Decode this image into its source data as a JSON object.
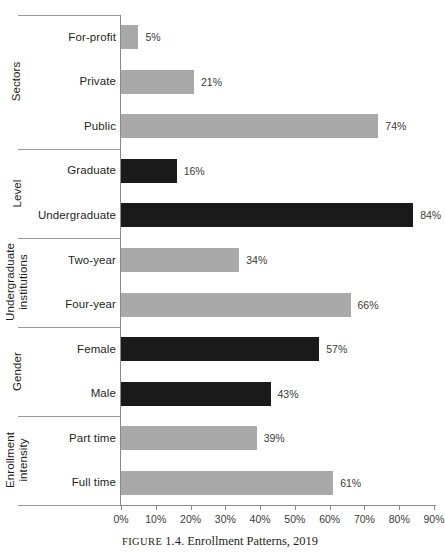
{
  "caption": {
    "figure_word": "FIGURE",
    "number": "1.4.",
    "title": "Enrollment Patterns, 2019"
  },
  "chart_data": {
    "type": "bar",
    "orientation": "horizontal",
    "title": "Enrollment Patterns, 2019",
    "xlabel": "",
    "ylabel": "",
    "xlim": [
      0,
      90
    ],
    "xticks": [
      "0%",
      "10%",
      "20%",
      "30%",
      "40%",
      "50%",
      "60%",
      "70%",
      "80%",
      "90%"
    ],
    "xtick_values": [
      0,
      10,
      20,
      30,
      40,
      50,
      60,
      70,
      80,
      90
    ],
    "grid": false,
    "legend": "none",
    "value_suffix": "%",
    "colors": {
      "light_bar": "#a9a9a9",
      "dark_bar": "#1a1a1a",
      "axis": "#8a8a8a",
      "text": "#231f20"
    },
    "groups": [
      {
        "name": "Sectors",
        "two_line": false,
        "categories": [
          "For-profit",
          "Private",
          "Public"
        ],
        "values": [
          5,
          21,
          74
        ],
        "labels": [
          "5%",
          "21%",
          "74%"
        ],
        "shade": "light"
      },
      {
        "name": "Level",
        "two_line": false,
        "categories": [
          "Graduate",
          "Undergraduate"
        ],
        "values": [
          16,
          84
        ],
        "labels": [
          "16%",
          "84%"
        ],
        "shade": "dark"
      },
      {
        "name": "Undergraduate institutions",
        "two_line": true,
        "categories": [
          "Two-year",
          "Four-year"
        ],
        "values": [
          34,
          66
        ],
        "labels": [
          "34%",
          "66%"
        ],
        "shade": "light"
      },
      {
        "name": "Gender",
        "two_line": false,
        "categories": [
          "Female",
          "Male"
        ],
        "values": [
          57,
          43
        ],
        "labels": [
          "57%",
          "43%"
        ],
        "shade": "dark"
      },
      {
        "name": "Enrollment intensity",
        "two_line": true,
        "categories": [
          "Part time",
          "Full time"
        ],
        "values": [
          39,
          61
        ],
        "labels": [
          "39%",
          "61%"
        ],
        "shade": "light"
      }
    ]
  }
}
